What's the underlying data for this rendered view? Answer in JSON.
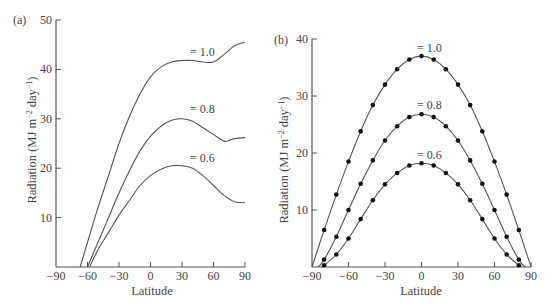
{
  "chart_data": [
    {
      "panel": "(a)",
      "type": "line",
      "title": "",
      "xlabel": "Latitude",
      "ylabel": "Radiation (MJ m⁻² day⁻¹)",
      "xlim": [
        -90,
        90
      ],
      "ylim": [
        0,
        50
      ],
      "xticks": [
        "-90",
        "-60",
        "-30",
        "0",
        "30",
        "60",
        "90"
      ],
      "yticks": [
        "10",
        "20",
        "30",
        "40",
        "50"
      ],
      "grid": false,
      "series": [
        {
          "name": "= 1.0",
          "x": [
            -67,
            -60,
            -50,
            -40,
            -30,
            -20,
            -10,
            0,
            10,
            20,
            30,
            40,
            50,
            60,
            70,
            80,
            90
          ],
          "values": [
            0,
            5,
            12,
            18.5,
            25,
            30.5,
            35,
            38.5,
            40.5,
            41.5,
            41.8,
            41.8,
            41.5,
            41.5,
            43,
            44.8,
            45.5
          ]
        },
        {
          "name": "= 0.8",
          "x": [
            -60,
            -50,
            -40,
            -30,
            -20,
            -10,
            0,
            10,
            20,
            30,
            40,
            50,
            60,
            70,
            73,
            80,
            90
          ],
          "values": [
            0,
            5,
            10,
            15,
            19.5,
            23.5,
            26.5,
            28.5,
            29.7,
            30,
            29.5,
            28.2,
            26.8,
            25.5,
            25.5,
            26,
            26.2
          ]
        },
        {
          "name": "= 0.6",
          "x": [
            -58,
            -50,
            -40,
            -30,
            -20,
            -10,
            0,
            10,
            20,
            30,
            40,
            50,
            60,
            70,
            80,
            90
          ],
          "values": [
            0,
            3.5,
            7,
            10.5,
            13.5,
            16.5,
            18.5,
            19.8,
            20.5,
            20.5,
            20,
            18.5,
            16.5,
            14.5,
            13.2,
            13
          ]
        }
      ]
    },
    {
      "panel": "(b)",
      "type": "line",
      "title": "",
      "xlabel": "Latitude",
      "ylabel": "Radiation (MJ m⁻² day⁻¹)",
      "xlim": [
        -90,
        90
      ],
      "ylim": [
        0,
        40
      ],
      "xticks": [
        "-90",
        "-60",
        "-30",
        "0",
        "30",
        "60",
        "90"
      ],
      "yticks": [
        "10",
        "20",
        "30",
        "40"
      ],
      "grid": false,
      "markers": "filled-circle",
      "series": [
        {
          "name": "= 1.0",
          "x": [
            -90,
            -80,
            -70,
            -60,
            -50,
            -40,
            -30,
            -20,
            -10,
            0,
            10,
            20,
            30,
            40,
            50,
            60,
            70,
            80,
            90
          ],
          "values": [
            0,
            6.5,
            12.7,
            18.5,
            23.8,
            28.4,
            32,
            34.7,
            36.4,
            37,
            36.4,
            34.7,
            32,
            28.4,
            23.8,
            18.5,
            12.7,
            6.5,
            0
          ]
        },
        {
          "name": "= 0.8",
          "x": [
            -85,
            -80,
            -70,
            -60,
            -50,
            -40,
            -30,
            -20,
            -10,
            0,
            10,
            20,
            30,
            40,
            50,
            60,
            70,
            80,
            85
          ],
          "values": [
            0,
            1.3,
            5.3,
            10,
            14.6,
            18.7,
            22.2,
            24.7,
            26.3,
            26.8,
            26.3,
            24.7,
            22.2,
            18.7,
            14.6,
            10,
            5.3,
            1.3,
            0
          ]
        },
        {
          "name": "= 0.6",
          "x": [
            -82,
            -80,
            -70,
            -60,
            -50,
            -40,
            -30,
            -20,
            -10,
            0,
            10,
            20,
            30,
            40,
            50,
            60,
            70,
            80,
            82
          ],
          "values": [
            0,
            0.3,
            2.2,
            5,
            8.4,
            11.7,
            14.5,
            16.5,
            17.8,
            18.2,
            17.8,
            16.5,
            14.5,
            11.7,
            8.4,
            5,
            2.2,
            0.3,
            0
          ]
        }
      ]
    }
  ],
  "panels": {
    "a": {
      "label": "(a)",
      "xlabel": "Latitude",
      "ylabel": "Radiation (MJ m",
      "curve_labels": [
        "= 1.0",
        "= 0.8",
        "= 0.6"
      ]
    },
    "b": {
      "label": "(b)",
      "xlabel": "Latitude",
      "ylabel": "Radiation (MJ m",
      "curve_labels": [
        "= 1.0",
        "= 0.8",
        "= 0.6"
      ]
    }
  }
}
